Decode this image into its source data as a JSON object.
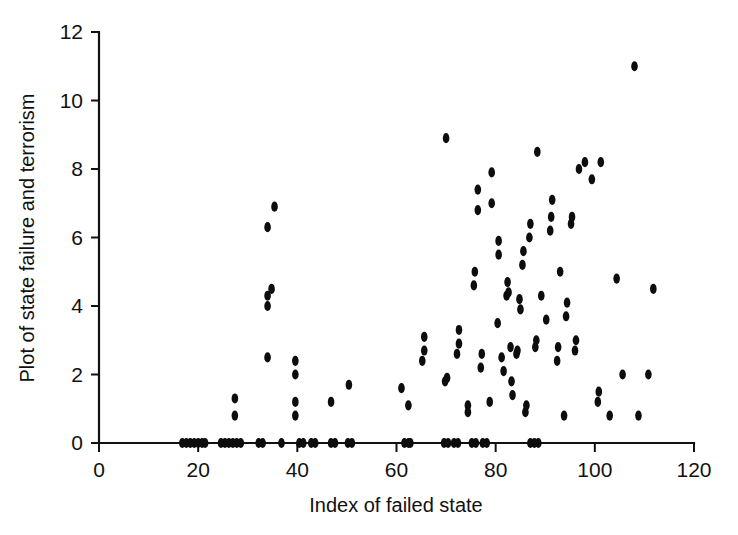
{
  "chart_data": {
    "type": "scatter",
    "title": "",
    "xlabel": "Index of failed state",
    "ylabel": "Plot of state failure and terrorism",
    "xlim": [
      0,
      120
    ],
    "ylim": [
      0,
      12
    ],
    "xticks": [
      0,
      20,
      40,
      60,
      80,
      100,
      120
    ],
    "yticks": [
      0,
      2,
      4,
      6,
      8,
      10,
      12
    ],
    "xtick_labels": [
      "0",
      "20",
      "40",
      "60",
      "80",
      "100",
      "120"
    ],
    "ytick_labels": [
      "0",
      "2",
      "4",
      "6",
      "8",
      "10",
      "12"
    ],
    "grid": false,
    "legend": "none",
    "marker": "filled-circle",
    "marker_color": "#0d0d0d",
    "marker_size": 5,
    "points": [
      [
        16.8,
        0.0
      ],
      [
        17.6,
        0.0
      ],
      [
        18.4,
        0.0
      ],
      [
        19.2,
        0.0
      ],
      [
        20.0,
        0.0
      ],
      [
        20.8,
        0.0
      ],
      [
        21.4,
        0.0
      ],
      [
        24.6,
        0.0
      ],
      [
        25.4,
        0.0
      ],
      [
        26.2,
        0.0
      ],
      [
        27.0,
        0.0
      ],
      [
        27.8,
        0.0
      ],
      [
        28.6,
        0.0
      ],
      [
        32.2,
        0.0
      ],
      [
        33.0,
        0.0
      ],
      [
        36.8,
        0.0
      ],
      [
        40.4,
        0.0
      ],
      [
        41.2,
        0.0
      ],
      [
        42.8,
        0.0
      ],
      [
        43.6,
        0.0
      ],
      [
        46.8,
        0.0
      ],
      [
        47.6,
        0.0
      ],
      [
        50.2,
        0.0
      ],
      [
        51.0,
        0.0
      ],
      [
        61.6,
        0.0
      ],
      [
        62.4,
        0.0
      ],
      [
        62.8,
        0.0
      ],
      [
        69.6,
        0.0
      ],
      [
        70.4,
        0.0
      ],
      [
        71.6,
        0.0
      ],
      [
        72.4,
        0.0
      ],
      [
        75.2,
        0.0
      ],
      [
        76.0,
        0.0
      ],
      [
        77.4,
        0.0
      ],
      [
        78.2,
        0.0
      ],
      [
        87.0,
        0.0
      ],
      [
        87.8,
        0.0
      ],
      [
        88.6,
        0.0
      ],
      [
        27.4,
        0.8
      ],
      [
        27.4,
        1.3
      ],
      [
        34.0,
        2.5
      ],
      [
        34.0,
        4.0
      ],
      [
        34.0,
        4.3
      ],
      [
        34.0,
        6.3
      ],
      [
        34.8,
        4.5
      ],
      [
        35.4,
        6.9
      ],
      [
        39.6,
        0.8
      ],
      [
        39.6,
        1.2
      ],
      [
        39.6,
        2.0
      ],
      [
        39.6,
        2.4
      ],
      [
        46.8,
        1.2
      ],
      [
        50.4,
        1.7
      ],
      [
        61.0,
        1.6
      ],
      [
        62.4,
        1.1
      ],
      [
        65.2,
        2.4
      ],
      [
        65.6,
        3.1
      ],
      [
        65.6,
        2.7
      ],
      [
        69.8,
        1.8
      ],
      [
        70.2,
        1.9
      ],
      [
        70.0,
        8.9
      ],
      [
        72.2,
        2.6
      ],
      [
        72.6,
        2.9
      ],
      [
        72.6,
        3.3
      ],
      [
        74.4,
        1.1
      ],
      [
        74.4,
        0.9
      ],
      [
        75.6,
        4.6
      ],
      [
        75.8,
        5.0
      ],
      [
        76.4,
        6.8
      ],
      [
        76.4,
        7.4
      ],
      [
        77.0,
        2.2
      ],
      [
        77.2,
        2.6
      ],
      [
        78.8,
        1.2
      ],
      [
        79.2,
        7.0
      ],
      [
        79.2,
        7.9
      ],
      [
        80.4,
        3.5
      ],
      [
        80.6,
        5.5
      ],
      [
        80.6,
        5.9
      ],
      [
        81.2,
        2.5
      ],
      [
        81.6,
        2.1
      ],
      [
        82.2,
        4.3
      ],
      [
        82.4,
        4.7
      ],
      [
        82.6,
        4.4
      ],
      [
        83.0,
        2.8
      ],
      [
        83.2,
        1.8
      ],
      [
        83.4,
        1.4
      ],
      [
        84.2,
        2.6
      ],
      [
        84.4,
        2.7
      ],
      [
        84.8,
        4.2
      ],
      [
        85.0,
        3.9
      ],
      [
        85.4,
        5.2
      ],
      [
        85.6,
        5.6
      ],
      [
        86.0,
        0.9
      ],
      [
        86.2,
        1.1
      ],
      [
        86.8,
        6.0
      ],
      [
        87.0,
        6.4
      ],
      [
        88.0,
        2.8
      ],
      [
        88.2,
        3.0
      ],
      [
        88.4,
        8.5
      ],
      [
        89.2,
        4.3
      ],
      [
        90.2,
        3.6
      ],
      [
        91.0,
        6.2
      ],
      [
        91.2,
        6.6
      ],
      [
        91.4,
        7.1
      ],
      [
        92.4,
        2.4
      ],
      [
        92.6,
        2.8
      ],
      [
        93.0,
        5.0
      ],
      [
        93.8,
        0.8
      ],
      [
        94.2,
        3.7
      ],
      [
        94.4,
        4.1
      ],
      [
        95.2,
        6.4
      ],
      [
        95.4,
        6.6
      ],
      [
        96.0,
        2.7
      ],
      [
        96.2,
        3.0
      ],
      [
        96.8,
        8.0
      ],
      [
        98.0,
        8.2
      ],
      [
        99.4,
        7.7
      ],
      [
        100.6,
        1.2
      ],
      [
        100.8,
        1.5
      ],
      [
        101.2,
        8.2
      ],
      [
        103.0,
        0.8
      ],
      [
        104.4,
        4.8
      ],
      [
        105.6,
        2.0
      ],
      [
        108.0,
        11.0
      ],
      [
        108.8,
        0.8
      ],
      [
        110.8,
        2.0
      ],
      [
        111.8,
        4.5
      ]
    ]
  },
  "axes": {
    "plot_left_px": 99,
    "plot_right_px": 694,
    "plot_bottom_px": 443,
    "plot_top_px": 32
  }
}
